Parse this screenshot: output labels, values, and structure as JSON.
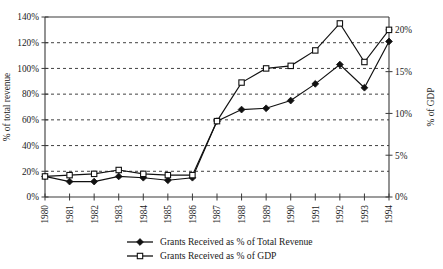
{
  "chart_data": {
    "type": "line",
    "title": "",
    "xlabel": "",
    "ylabel": "% of total revenue",
    "y2label": "% of GDP",
    "grid": true,
    "legend_position": "bottom",
    "categories": [
      "1980",
      "1981",
      "1982",
      "1983",
      "1984",
      "1985",
      "1986",
      "1987",
      "1988",
      "1989",
      "1990",
      "1991",
      "1992",
      "1993",
      "1994"
    ],
    "x": [
      1980,
      1981,
      1982,
      1983,
      1984,
      1985,
      1986,
      1987,
      1988,
      1989,
      1990,
      1991,
      1992,
      1993,
      1994
    ],
    "ylim": [
      0,
      140
    ],
    "yticks": [
      0,
      20,
      40,
      60,
      80,
      100,
      120,
      140
    ],
    "ytick_labels": [
      "0%",
      "20%",
      "40%",
      "60%",
      "80%",
      "100%",
      "120%",
      "140%"
    ],
    "y2lim": [
      0,
      21.54
    ],
    "y2ticks": [
      0,
      5,
      10,
      15,
      20
    ],
    "y2tick_labels": [
      "0%",
      "5%",
      "10%",
      "15%",
      "20%"
    ],
    "series": [
      {
        "name": "Grants Received as % of Total Revenue",
        "axis": "left",
        "marker": "filled-diamond",
        "values": [
          16,
          12,
          12,
          16,
          15,
          13,
          15,
          59,
          68,
          69,
          75,
          88,
          103,
          85,
          121
        ]
      },
      {
        "name": "Grants Received as % of GDP",
        "axis": "left",
        "marker": "open-square",
        "values": [
          16,
          17,
          18,
          21,
          18,
          17,
          17,
          59,
          89,
          100,
          102,
          114,
          135,
          105,
          130
        ]
      }
    ],
    "series_gdp_actual": {
      "note": "second series values expressed on right-hand GDP axis",
      "values": [
        2.5,
        2.6,
        2.8,
        3.2,
        2.8,
        2.6,
        2.6,
        9.1,
        13.7,
        15.4,
        15.7,
        17.5,
        20.8,
        16.2,
        20.0
      ]
    }
  },
  "legend": {
    "items": [
      {
        "label": "Grants Received as % of Total Revenue",
        "marker": "filled-diamond"
      },
      {
        "label": "Grants Received as % of GDP",
        "marker": "open-square"
      }
    ]
  },
  "colors": {
    "line": "#111111",
    "grid": "#2b2b2b",
    "axis": "#3a3a3a",
    "background": "#ffffff"
  }
}
